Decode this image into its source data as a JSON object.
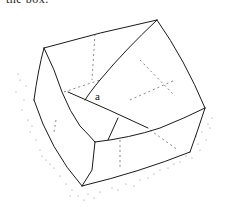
{
  "caption_fragment": "the box.",
  "figure": {
    "labels": [
      {
        "id": "a",
        "text": "a"
      }
    ],
    "colors": {
      "ink": "#1a1a1a",
      "stipple": "#8a8a8a",
      "background": "#ffffff"
    }
  }
}
